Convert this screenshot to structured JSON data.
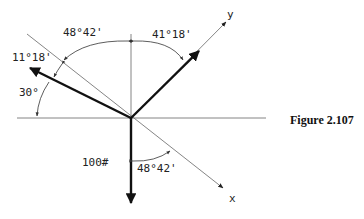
{
  "figure": {
    "caption": "Figure 2.107",
    "axes": {
      "x_label": "x",
      "y_label": "y"
    },
    "angles": {
      "top_left": "48°42'",
      "top_right": "41°18'",
      "left_small": "11°18'",
      "left_lower": "30°",
      "bottom": "48°42'"
    },
    "forces": {
      "weight": "100#"
    },
    "colors": {
      "line": "#777777",
      "force": "#111111",
      "text": "#222222"
    }
  }
}
